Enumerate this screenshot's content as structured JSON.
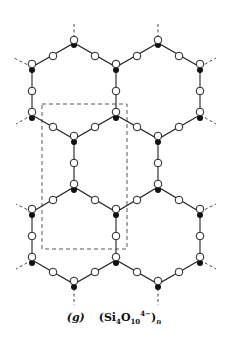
{
  "figure": {
    "label": "(g)",
    "formula": {
      "open": "(Si",
      "si_sub": "4",
      "o": "O",
      "o_sub": "10",
      "charge": "4−",
      "close": ")",
      "n": "n"
    }
  },
  "legend": {
    "si_atom": "filled dot",
    "o_atom": "open circle",
    "unit_cell": "dashed rectangle"
  },
  "lattice": {
    "si_vertices": [
      [
        74,
        42
      ],
      [
        158,
        42
      ],
      [
        32,
        67
      ],
      [
        116,
        67
      ],
      [
        200,
        67
      ],
      [
        32,
        115
      ],
      [
        116,
        115
      ],
      [
        200,
        115
      ],
      [
        74,
        139
      ],
      [
        158,
        139
      ],
      [
        74,
        187
      ],
      [
        158,
        187
      ],
      [
        32,
        212
      ],
      [
        116,
        212
      ],
      [
        200,
        212
      ],
      [
        32,
        260
      ],
      [
        116,
        260
      ],
      [
        200,
        260
      ],
      [
        74,
        284
      ],
      [
        158,
        284
      ]
    ],
    "unit_cell": {
      "x": 42,
      "y": 104,
      "width": 85,
      "height": 145
    }
  }
}
